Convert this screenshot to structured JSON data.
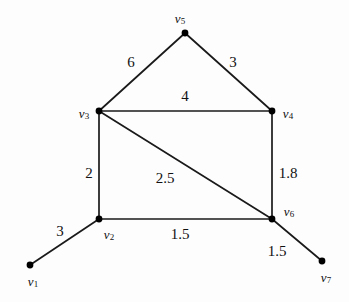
{
  "figure": {
    "background_color": "#fdfdfd",
    "edge_color": "#1a1a1a",
    "node_color": "#000000",
    "label_color": "#111111",
    "width": 349,
    "height": 302
  },
  "graph_data": {
    "type": "node-link-diagram",
    "directed": false,
    "weighted": true,
    "nodes": [
      {
        "id": "v1",
        "label": "v",
        "sub": "1",
        "x": 30,
        "y": 265,
        "label_x": 33,
        "label_y": 282
      },
      {
        "id": "v2",
        "label": "v",
        "sub": "2",
        "x": 99,
        "y": 219,
        "label_x": 109,
        "label_y": 235
      },
      {
        "id": "v3",
        "label": "v",
        "sub": "3",
        "x": 99,
        "y": 111,
        "label_x": 84,
        "label_y": 114
      },
      {
        "id": "v4",
        "label": "v",
        "sub": "4",
        "x": 272,
        "y": 111,
        "label_x": 288,
        "label_y": 114
      },
      {
        "id": "v5",
        "label": "v",
        "sub": "5",
        "x": 185,
        "y": 33,
        "label_x": 180,
        "label_y": 19
      },
      {
        "id": "v6",
        "label": "v",
        "sub": "6",
        "x": 272,
        "y": 219,
        "label_x": 289,
        "label_y": 212
      },
      {
        "id": "v7",
        "label": "v",
        "sub": "7",
        "x": 322,
        "y": 261,
        "label_x": 326,
        "label_y": 278
      }
    ],
    "edges": [
      {
        "id": "e-v3-v5",
        "source": "v3",
        "target": "v5",
        "weight": "6",
        "label_x": 131,
        "label_y": 62
      },
      {
        "id": "e-v5-v4",
        "source": "v5",
        "target": "v4",
        "weight": "3",
        "label_x": 233,
        "label_y": 62
      },
      {
        "id": "e-v3-v4",
        "source": "v3",
        "target": "v4",
        "weight": "4",
        "label_x": 185,
        "label_y": 96
      },
      {
        "id": "e-v3-v2",
        "source": "v3",
        "target": "v2",
        "weight": "2",
        "label_x": 89,
        "label_y": 173
      },
      {
        "id": "e-v3-v6",
        "source": "v3",
        "target": "v6",
        "weight": "2.5",
        "label_x": 165,
        "label_y": 178
      },
      {
        "id": "e-v4-v6",
        "source": "v4",
        "target": "v6",
        "weight": "1.8",
        "label_x": 288,
        "label_y": 173
      },
      {
        "id": "e-v2-v6",
        "source": "v2",
        "target": "v6",
        "weight": "1.5",
        "label_x": 180,
        "label_y": 234
      },
      {
        "id": "e-v1-v2",
        "source": "v1",
        "target": "v2",
        "weight": "3",
        "label_x": 60,
        "label_y": 231
      },
      {
        "id": "e-v6-v7",
        "source": "v6",
        "target": "v7",
        "weight": "1.5",
        "label_x": 277,
        "label_y": 251
      }
    ]
  }
}
